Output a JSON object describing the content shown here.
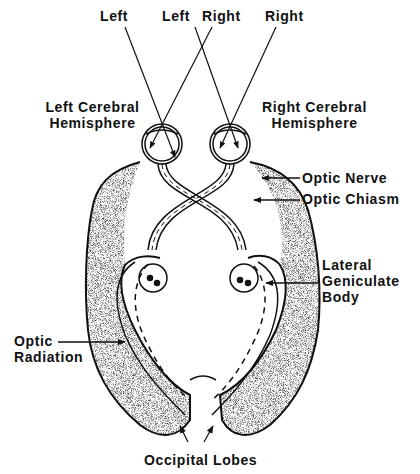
{
  "diagram": {
    "colors": {
      "ink": "#111111",
      "background": "#ffffff",
      "stipple": "#555555"
    },
    "labels": {
      "left": "Left",
      "left_right_left": "Left",
      "left_right_right": "Right",
      "right": "Right",
      "left_hemisphere_line1": "Left Cerebral",
      "left_hemisphere_line2": "Hemisphere",
      "right_hemisphere_line1": "Right Cerebral",
      "right_hemisphere_line2": "Hemisphere",
      "optic_nerve": "Optic Nerve",
      "optic_chiasm": "Optic Chiasm",
      "lgb_line1": "Lateral",
      "lgb_line2": "Geniculate",
      "lgb_line3": "Body",
      "optic_radiation_line1": "Optic",
      "optic_radiation_line2": "Radiation",
      "occipital_lobes": "Occipital Lobes"
    }
  }
}
